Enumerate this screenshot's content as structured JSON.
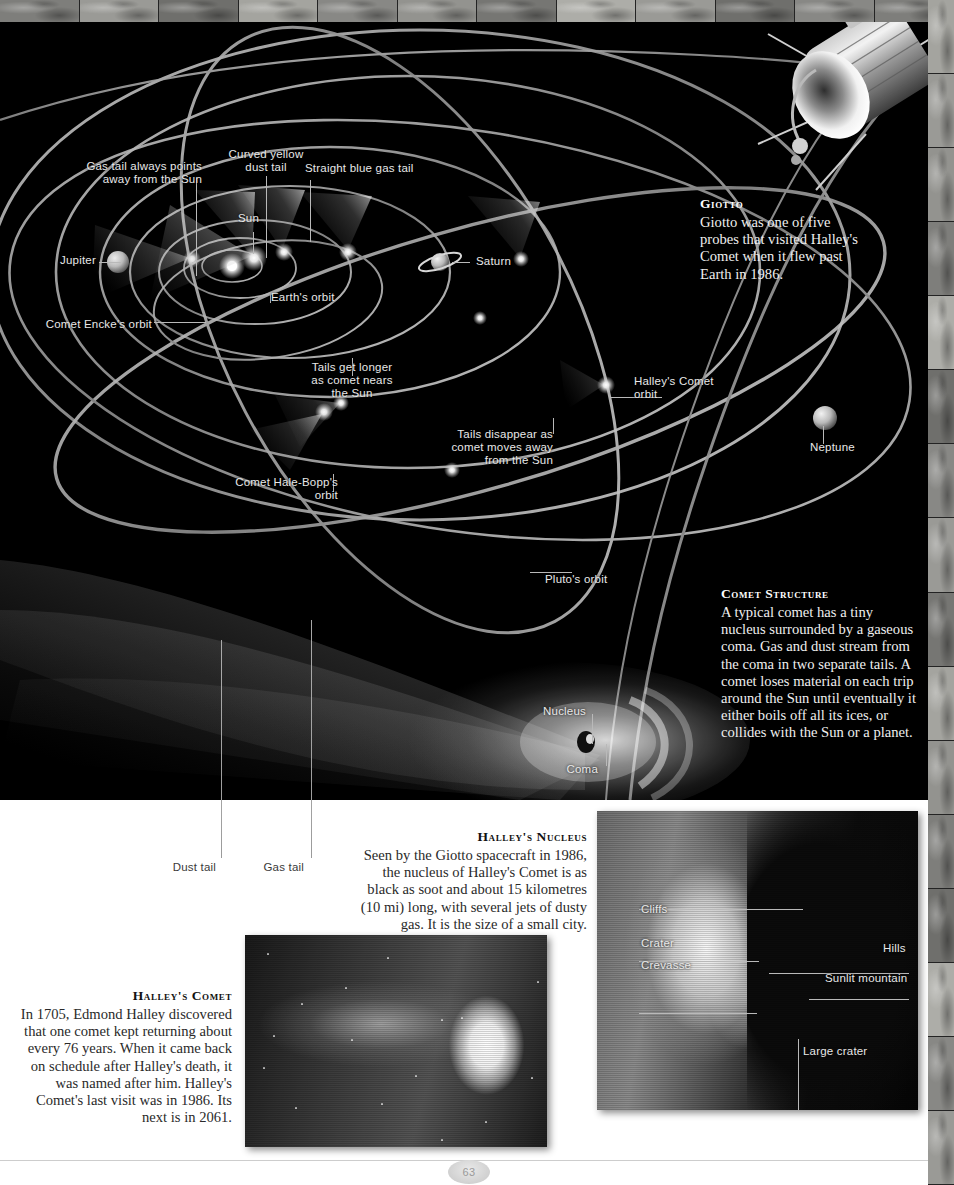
{
  "page": {
    "folio": "63"
  },
  "diagram": {
    "labels": [
      {
        "id": "gas-tail-points-away",
        "text": "Gas tail always points\naway from the Sun"
      },
      {
        "id": "curved-yellow-dust-tail",
        "text": "Curved yellow\ndust tail"
      },
      {
        "id": "straight-blue-gas-tail",
        "text": "Straight blue gas tail"
      },
      {
        "id": "sun",
        "text": "Sun"
      },
      {
        "id": "jupiter",
        "text": "Jupiter"
      },
      {
        "id": "saturn",
        "text": "Saturn"
      },
      {
        "id": "neptune",
        "text": "Neptune"
      },
      {
        "id": "earths-orbit",
        "text": "Earth's orbit"
      },
      {
        "id": "comet-enckes-orbit",
        "text": "Comet Encke's orbit"
      },
      {
        "id": "comet-hale-bopps-orbit",
        "text": "Comet Hale-Bopp's\norbit"
      },
      {
        "id": "halleys-comet-orbit",
        "text": "Halley's Comet\norbit"
      },
      {
        "id": "plutos-orbit",
        "text": "Pluto's orbit"
      },
      {
        "id": "tails-get-longer",
        "text": "Tails get longer\nas comet nears\nthe Sun"
      },
      {
        "id": "tails-disappear",
        "text": "Tails disappear as\ncomet moves away\nfrom the Sun"
      },
      {
        "id": "nucleus",
        "text": "Nucleus"
      },
      {
        "id": "coma",
        "text": "Coma"
      },
      {
        "id": "dust-tail",
        "text": "Dust tail"
      },
      {
        "id": "gas-tail",
        "text": "Gas tail"
      }
    ]
  },
  "captions": {
    "giotto": {
      "title": "Giotto",
      "body": "Giotto was one of five probes that visited Halley's Comet when it flew past Earth in 1986."
    },
    "comet_structure": {
      "title": "Comet Structure",
      "body": "A typical comet has a tiny nucleus surrounded by a gaseous coma. Gas and dust stream from the coma in two separate tails. A comet loses material on each trip around the Sun until eventually it either boils off all its ices, or collides with the Sun or a planet."
    },
    "halleys_nucleus": {
      "title": "Halley's Nucleus",
      "body": "Seen by the Giotto spacecraft in 1986, the nucleus of Halley's Comet is as black as soot and about 15 kilometres (10 mi) long, with several jets of dusty gas. It is the size of a small city."
    },
    "halleys_comet": {
      "title": "Halley's Comet",
      "body": "In 1705, Edmond Halley discovered that one comet kept returning about every 76 years. When it came back on schedule after Halley's death, it was named after him. Halley's Comet's last visit was in 1986. Its next is in 2061."
    }
  },
  "nucleus_photo": {
    "labels": [
      {
        "id": "cliffs",
        "text": "Cliffs"
      },
      {
        "id": "crater",
        "text": "Crater"
      },
      {
        "id": "crevasse",
        "text": "Crevasse"
      },
      {
        "id": "hills",
        "text": "Hills"
      },
      {
        "id": "sunlit-mountain",
        "text": "Sunlit mountain"
      },
      {
        "id": "large-crater",
        "text": "Large crater"
      }
    ]
  },
  "colors": {
    "page_background": "#000000",
    "paper": "#ffffff",
    "label_light": "#e8e8e8",
    "label_dark": "#3a3a3a",
    "orbit_line": "#b5b5b5"
  }
}
